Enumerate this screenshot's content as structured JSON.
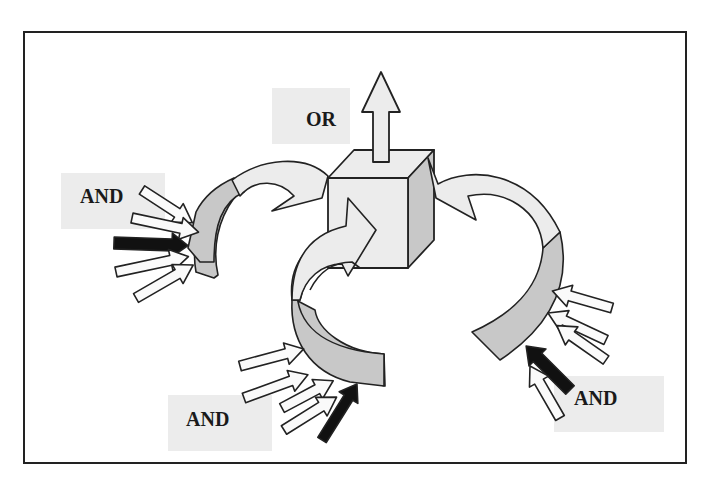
{
  "diagram": {
    "frame": {
      "x": 24,
      "y": 32,
      "width": 662,
      "height": 431,
      "stroke": "#222222"
    },
    "colors": {
      "light_fill": "#ececec",
      "dark_fill": "#c8c8c8",
      "black_fill": "#111111",
      "stroke": "#222222",
      "label_bg": "#ececec"
    },
    "labels": [
      {
        "id": "or",
        "text": "OR",
        "box": {
          "x": 272,
          "y": 88,
          "w": 78,
          "h": 56
        },
        "text_pos": {
          "x": 306,
          "y": 128
        }
      },
      {
        "id": "and-left",
        "text": "AND",
        "box": {
          "x": 61,
          "y": 173,
          "w": 104,
          "h": 56
        },
        "text_pos": {
          "x": 80,
          "y": 205
        }
      },
      {
        "id": "and-bottom",
        "text": "AND",
        "box": {
          "x": 168,
          "y": 395,
          "w": 104,
          "h": 56
        },
        "text_pos": {
          "x": 186,
          "y": 428
        }
      },
      {
        "id": "and-right",
        "text": "AND",
        "box": {
          "x": 554,
          "y": 376,
          "w": 110,
          "h": 56
        },
        "text_pos": {
          "x": 574,
          "y": 407
        }
      }
    ],
    "nodes": {
      "cube": {
        "label": "output node (cube)"
      },
      "output_arrow": {
        "label": "OR output"
      }
    }
  }
}
